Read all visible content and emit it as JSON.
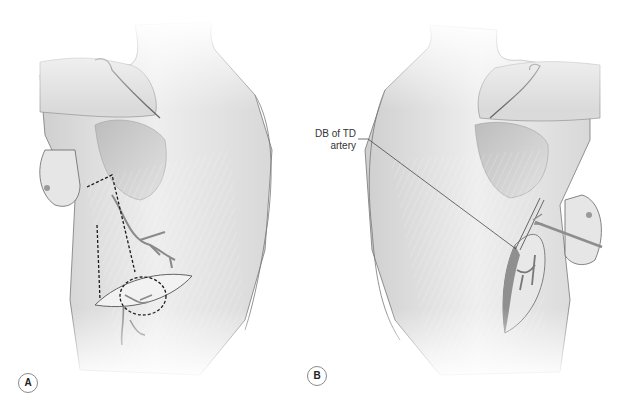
{
  "figure": {
    "panels": [
      {
        "id": "A",
        "label": "A",
        "description": "Posterior view, left side; dashed lines mark skin paddle / flap outline over latissimus dorsi with circled descending branch"
      },
      {
        "id": "B",
        "label": "B",
        "description": "Posterior view, right side; flap elevated with retractor, vessel exposed"
      }
    ],
    "annotations": [
      {
        "panel": "B",
        "text_line1": "DB of TD",
        "text_line2": "artery"
      }
    ],
    "colors": {
      "background": "#ffffff",
      "skin_light": "#ececec",
      "skin_mid": "#d6d6d6",
      "shadow": "#a8a8a8",
      "outline": "#555555",
      "dash": "#1a1a1a"
    }
  }
}
